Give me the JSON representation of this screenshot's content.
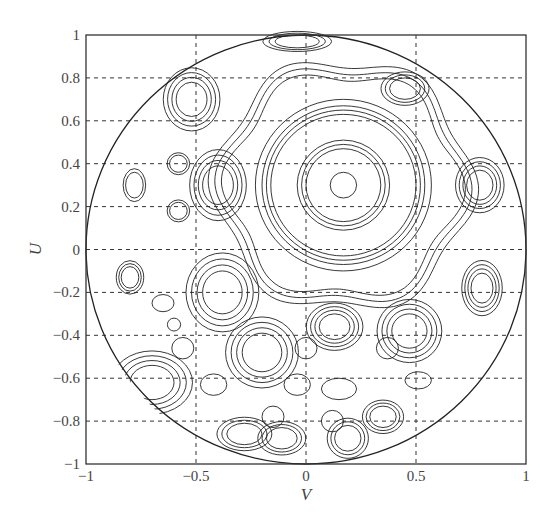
{
  "chart_data": {
    "type": "contour",
    "title": "",
    "xlabel": "V",
    "ylabel": "U",
    "xlim": [
      -1,
      1
    ],
    "ylim": [
      -1,
      1
    ],
    "grid": true,
    "grid_style": "dashed",
    "legend": null,
    "x_ticks": [
      -1,
      -0.5,
      0,
      0.5,
      1
    ],
    "x_tick_labels": [
      "−1",
      "−0.5",
      "0",
      "0.5",
      "1"
    ],
    "y_ticks": [
      1,
      0.8,
      0.6,
      0.4,
      0.2,
      0,
      -0.2,
      -0.4,
      -0.6,
      -0.8,
      -1
    ],
    "y_tick_labels": [
      "1",
      "0.8",
      "0.6",
      "0.4",
      "0.2",
      "0",
      "−0.2",
      "−0.4",
      "−0.6",
      "−0.8",
      "−1"
    ],
    "domain_boundary": {
      "shape": "circle",
      "center": [
        0,
        0
      ],
      "radius": 1
    },
    "main_beam": {
      "center": [
        0.17,
        0.3
      ],
      "ring_radii": [
        0.06,
        0.17,
        0.19,
        0.21,
        0.33,
        0.35,
        0.37,
        0.4
      ]
    },
    "outer_wavy_ring": {
      "center": [
        0.17,
        0.3
      ],
      "radius": [
        0.52,
        0.55,
        0.58
      ],
      "lobes": 6,
      "amplitude": 0.035
    },
    "sidelobes": [
      {
        "center": [
          -0.52,
          0.7
        ],
        "rx": 0.07,
        "ry": 0.08,
        "levels": 4
      },
      {
        "center": [
          -0.04,
          0.97
        ],
        "rx": 0.1,
        "ry": 0.03,
        "levels": 3
      },
      {
        "center": [
          0.45,
          0.75
        ],
        "rx": 0.07,
        "ry": 0.05,
        "levels": 3
      },
      {
        "center": [
          -0.78,
          0.3
        ],
        "rx": 0.04,
        "ry": 0.06,
        "levels": 2
      },
      {
        "center": [
          -0.58,
          0.4
        ],
        "rx": 0.04,
        "ry": 0.04,
        "levels": 2
      },
      {
        "center": [
          -0.58,
          0.18
        ],
        "rx": 0.04,
        "ry": 0.04,
        "levels": 2
      },
      {
        "center": [
          -0.4,
          0.3
        ],
        "rx": 0.07,
        "ry": 0.09,
        "levels": 4
      },
      {
        "center": [
          0.79,
          0.3
        ],
        "rx": 0.06,
        "ry": 0.07,
        "levels": 4
      },
      {
        "center": [
          -0.8,
          -0.13
        ],
        "rx": 0.04,
        "ry": 0.05,
        "levels": 3
      },
      {
        "center": [
          -0.38,
          -0.2
        ],
        "rx": 0.09,
        "ry": 0.1,
        "levels": 4
      },
      {
        "center": [
          -0.65,
          -0.25
        ],
        "rx": 0.05,
        "ry": 0.04,
        "levels": 1
      },
      {
        "center": [
          0.13,
          -0.36
        ],
        "rx": 0.07,
        "ry": 0.06,
        "levels": 4
      },
      {
        "center": [
          -0.2,
          -0.48
        ],
        "rx": 0.09,
        "ry": 0.09,
        "levels": 4
      },
      {
        "center": [
          0.47,
          -0.38
        ],
        "rx": 0.08,
        "ry": 0.08,
        "levels": 4
      },
      {
        "center": [
          0.8,
          -0.18
        ],
        "rx": 0.05,
        "ry": 0.07,
        "levels": 4
      },
      {
        "center": [
          -0.56,
          -0.46
        ],
        "rx": 0.05,
        "ry": 0.05,
        "levels": 1
      },
      {
        "center": [
          0.0,
          -0.46
        ],
        "rx": 0.05,
        "ry": 0.05,
        "levels": 1
      },
      {
        "center": [
          0.37,
          -0.46
        ],
        "rx": 0.05,
        "ry": 0.05,
        "levels": 1
      },
      {
        "center": [
          -0.7,
          -0.62
        ],
        "rx": 0.1,
        "ry": 0.08,
        "levels": 4
      },
      {
        "center": [
          -0.42,
          -0.63
        ],
        "rx": 0.06,
        "ry": 0.05,
        "levels": 1
      },
      {
        "center": [
          -0.04,
          -0.63
        ],
        "rx": 0.06,
        "ry": 0.05,
        "levels": 1
      },
      {
        "center": [
          0.15,
          -0.65
        ],
        "rx": 0.08,
        "ry": 0.05,
        "levels": 1
      },
      {
        "center": [
          0.51,
          -0.61
        ],
        "rx": 0.06,
        "ry": 0.04,
        "levels": 1
      },
      {
        "center": [
          -0.15,
          -0.78
        ],
        "rx": 0.05,
        "ry": 0.05,
        "levels": 1
      },
      {
        "center": [
          0.35,
          -0.78
        ],
        "rx": 0.06,
        "ry": 0.05,
        "levels": 3
      },
      {
        "center": [
          0.12,
          -0.8
        ],
        "rx": 0.05,
        "ry": 0.05,
        "levels": 1
      },
      {
        "center": [
          0.19,
          -0.88
        ],
        "rx": 0.06,
        "ry": 0.06,
        "levels": 3
      },
      {
        "center": [
          -0.11,
          -0.88
        ],
        "rx": 0.07,
        "ry": 0.05,
        "levels": 3
      },
      {
        "center": [
          -0.28,
          -0.86
        ],
        "rx": 0.08,
        "ry": 0.05,
        "levels": 3
      },
      {
        "center": [
          -0.6,
          -0.35
        ],
        "rx": 0.03,
        "ry": 0.03,
        "levels": 1
      }
    ]
  },
  "axes": {
    "xlabel": "V",
    "ylabel": "U"
  }
}
